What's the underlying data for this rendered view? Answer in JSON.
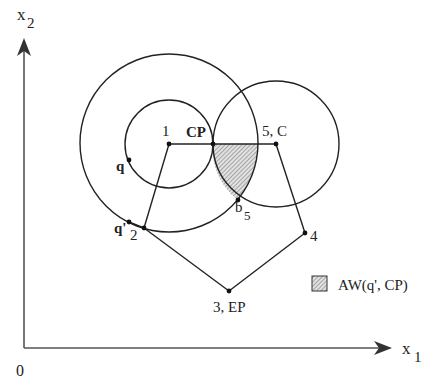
{
  "axes": {
    "origin_label": "0",
    "x_label": "x",
    "x_sub": "1",
    "y_label": "x",
    "y_sub": "2"
  },
  "nodes": {
    "n1": {
      "label": "1"
    },
    "cp": {
      "label": "CP"
    },
    "n5": {
      "label": "5, C"
    },
    "n2": {
      "label": "2"
    },
    "n3": {
      "label": "3, EP"
    },
    "n4": {
      "label": "4"
    },
    "q": {
      "label": "q"
    },
    "qprime": {
      "label": "q'"
    },
    "b5": {
      "label": "b",
      "sub": "5"
    }
  },
  "legend": {
    "label": "AW(q', CP)",
    "swatch_color": "#b0b0b0"
  },
  "colors": {
    "stroke": "#222222",
    "axis": "#555555",
    "hatch": "#999999"
  }
}
